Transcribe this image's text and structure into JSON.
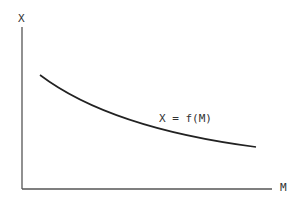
{
  "diagram": {
    "y_axis_label": "X",
    "x_axis_label": "M",
    "curve_label": "X = f(M)",
    "curve_description": "decreasing convex curve",
    "line_color": "#333333",
    "axis_color": "#555555"
  }
}
